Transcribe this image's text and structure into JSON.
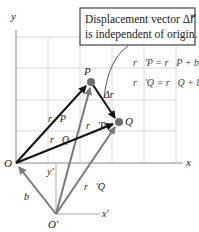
{
  "diagram": {
    "callout": {
      "line1": "Displacement vector Δr⃗",
      "line2": "is independent of origin."
    },
    "equations": [
      "r⃗′P = r⃗P + b⃗",
      "r⃗′Q = r⃗Q + b⃗"
    ],
    "axes": {
      "x": "x",
      "y": "y",
      "x_prime": "x′",
      "y_prime": "y′"
    },
    "points": {
      "origin": "O",
      "origin_prime": "O′",
      "P": "P",
      "Q": "Q"
    },
    "vectors": {
      "rP": "r⃗P",
      "rQ": "r⃗Q",
      "rP_prime": "r⃗′P",
      "rQ_prime": "r⃗′Q",
      "b": "b⃗",
      "delta_r": "Δr⃗"
    },
    "colors": {
      "black_vector": "#111111",
      "gray_vector": "#808080",
      "grid": "#d8d8d8",
      "point": "#6e6e6e"
    }
  }
}
